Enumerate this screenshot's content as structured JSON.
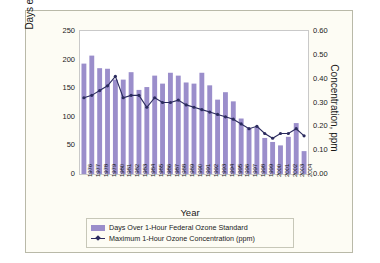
{
  "chart_data": {
    "type": "bar",
    "title": "",
    "xlabel": "Year",
    "ylabel": "Days exceeding federal standard",
    "y2label": "Concentration, ppm",
    "ylim": [
      0,
      250
    ],
    "y2lim": [
      0.0,
      0.6
    ],
    "yticks": [
      "0",
      "50",
      "100",
      "150",
      "200",
      "250"
    ],
    "y2ticks": [
      "0.00",
      "0.10",
      "0.20",
      "0.30",
      "0.40",
      "0.50",
      "0.60"
    ],
    "grid": false,
    "legend_position": "bottom",
    "categories": [
      "1976",
      "1977",
      "1978",
      "1979",
      "1980",
      "1981",
      "1982",
      "1983",
      "1984",
      "1985",
      "1986",
      "1987",
      "1988",
      "1989",
      "1990",
      "1991",
      "1992",
      "1993",
      "1994",
      "1995",
      "1996",
      "1997",
      "1998",
      "1999",
      "2000",
      "2001",
      "2002",
      "2003",
      "2004"
    ],
    "series": [
      {
        "name": "Days Over 1-Hour Federal Ozone Standard",
        "type": "bar",
        "axis": "left",
        "color": "#9b8ecb",
        "values": [
          193,
          207,
          185,
          184,
          165,
          165,
          178,
          147,
          152,
          172,
          158,
          177,
          172,
          160,
          158,
          177,
          155,
          130,
          143,
          127,
          97,
          80,
          82,
          63,
          56,
          50,
          65,
          89,
          40
        ]
      },
      {
        "name": "Maximum 1-Hour Ozone Concentration (ppm)",
        "type": "line",
        "axis": "right",
        "color": "#2b2b5e",
        "values": [
          0.32,
          0.33,
          0.35,
          0.37,
          0.41,
          0.32,
          0.33,
          0.33,
          0.28,
          0.32,
          0.3,
          0.3,
          0.31,
          0.29,
          0.28,
          0.27,
          0.26,
          0.25,
          0.24,
          0.23,
          0.21,
          0.19,
          0.2,
          0.17,
          0.15,
          0.17,
          0.17,
          0.19,
          0.16
        ]
      }
    ]
  },
  "legend": {
    "items": [
      {
        "label": "Days Over 1-Hour Federal Ozone Standard",
        "marker": "swatch"
      },
      {
        "label": "Maximum 1-Hour Ozone Concentration (ppm)",
        "marker": "line-diamond"
      }
    ]
  },
  "colors": {
    "bar": "#9b8ecb",
    "line": "#2b2b5e",
    "panel": "#fdfcf4",
    "plot_bg": "#ffffff",
    "frame_border": "#b9b9a8"
  }
}
